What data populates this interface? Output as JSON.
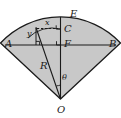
{
  "figure": {
    "caption": "",
    "type": "geometry-diagram",
    "shape": "circular-sector",
    "colors": {
      "stroke": "#1a1a1a",
      "fill": "#c8c8c8",
      "dashed": "#1a1a1a",
      "background": "#ffffff",
      "ghost_text": "#c9c6c2"
    },
    "labels": {
      "center": "O",
      "left_endpoint": "A",
      "right_endpoint": "B",
      "arc_top": "E",
      "inner_arc_point": "C",
      "chord_foot": "F",
      "radius": "R",
      "angle": "θ",
      "horizontal_segment": "x",
      "vertical_segment": "y"
    },
    "geometry": {
      "center_point": {
        "x": 60.5,
        "y": 99
      },
      "radius_px": 82,
      "half_angle_deg": 47,
      "chord_y": 45,
      "arc_top_y": 17,
      "inner_arc_point_y": 29,
      "point_on_arc": {
        "x": 36,
        "y": 27
      }
    },
    "right_angle_marks": [
      "at-C-between-dashed-x-and-vertical",
      "at-F-on-chord-AB",
      "at-base-of-y-segment"
    ],
    "ghost_text": {
      "top": "",
      "bottom": ""
    }
  }
}
